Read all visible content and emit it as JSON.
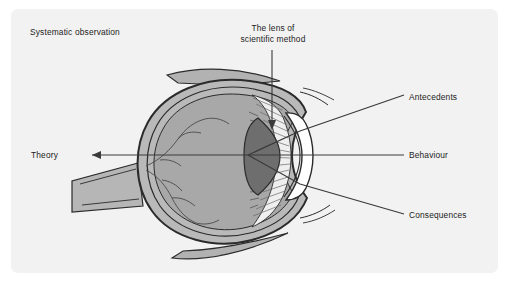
{
  "figure": {
    "title": "The lens of scientific method",
    "panel_bg": "#f2f2f2",
    "page_bg": "#ffffff",
    "ink": "#1c1c1c"
  },
  "labels": {
    "systematic_observation": "Systematic observation",
    "lens_line1": "The lens of",
    "lens_line2": "scientific method",
    "antecedents": "Antecedents",
    "behaviour": "Behaviour",
    "consequences": "Consequences",
    "theory": "Theory"
  },
  "diagram": {
    "type": "annotated-anatomical-illustration",
    "colors": {
      "sclera_outer": "#b9b9b9",
      "vitreous": "#a8a8a8",
      "lens": "#6e6e6e",
      "cornea": "#ffffff",
      "ciliary": "#efefef",
      "muscle": "#b0b0b0",
      "outline": "#2b2b2b"
    },
    "annotations": [
      {
        "name": "systematic-observation",
        "side": "top-left",
        "connector": "none"
      },
      {
        "name": "lens-of-scientific-method",
        "side": "top",
        "connector": "vertical-arrow-to-lens"
      },
      {
        "name": "antecedents",
        "side": "right",
        "connector": "diagonal-ray-upper"
      },
      {
        "name": "behaviour",
        "side": "right",
        "connector": "horizontal-ray-axis"
      },
      {
        "name": "consequences",
        "side": "right",
        "connector": "diagonal-ray-lower"
      },
      {
        "name": "theory",
        "side": "left",
        "connector": "horizontal-arrow-left"
      }
    ],
    "rays": {
      "count": 3,
      "direction": "right-to-left converging through lens",
      "focus_point": [
        248,
        155
      ]
    }
  }
}
